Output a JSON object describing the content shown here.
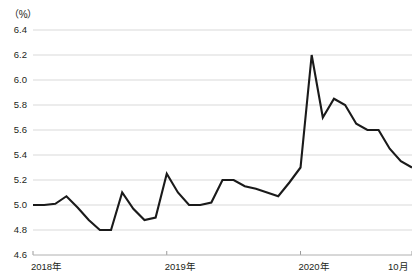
{
  "chart_data": {
    "type": "line",
    "title": "",
    "subtitle": "",
    "unit_label": "（%）",
    "xlabel": "",
    "ylabel": "",
    "ylim": [
      4.6,
      6.4
    ],
    "yticks": [
      "4.6",
      "4.8",
      "5.0",
      "5.2",
      "5.4",
      "5.6",
      "5.8",
      "6.0",
      "6.2",
      "6.4"
    ],
    "ytick_values": [
      4.6,
      4.8,
      5.0,
      5.2,
      5.4,
      5.6,
      5.8,
      6.0,
      6.2,
      6.4
    ],
    "xticks": [
      "2018年",
      "2019年",
      "2020年",
      "10月"
    ],
    "xtick_positions": [
      0,
      12,
      24,
      34
    ],
    "xlim": [
      0,
      34
    ],
    "grid": true,
    "legend": null,
    "line_color": "#1a1a1a",
    "grid_color": "#d9d9d9",
    "axis_color": "#b3b3b3",
    "series": [
      {
        "name": "失業率",
        "x": [
          0,
          1,
          2,
          3,
          4,
          5,
          6,
          7,
          8,
          9,
          10,
          11,
          12,
          13,
          14,
          15,
          16,
          17,
          18,
          19,
          20,
          21,
          22,
          23,
          24,
          25,
          26,
          27,
          28,
          29,
          30,
          31,
          32,
          33,
          34
        ],
        "values": [
          5.0,
          5.0,
          5.01,
          5.07,
          4.98,
          4.88,
          4.8,
          4.8,
          5.1,
          4.97,
          4.88,
          4.9,
          5.25,
          5.1,
          5.0,
          5.0,
          5.02,
          5.2,
          5.2,
          5.15,
          5.13,
          5.1,
          5.07,
          5.18,
          5.3,
          6.2,
          5.7,
          5.85,
          5.8,
          5.65,
          5.6,
          5.6,
          5.45,
          5.35,
          5.3
        ]
      }
    ]
  }
}
